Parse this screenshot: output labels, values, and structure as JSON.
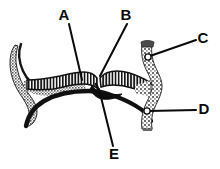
{
  "figure": {
    "kind": "labeled-anatomical-diagram",
    "background_color": "#ffffff",
    "ink_color": "#0a0a0a",
    "shade_color": "#9a9a9a",
    "hatch_color": "#1a1a1a",
    "width": 220,
    "height": 169,
    "caption": ""
  },
  "labels": [
    {
      "id": "A",
      "text": "A",
      "text_x": 64,
      "text_y": 16,
      "leader": {
        "x1": 69,
        "y1": 24,
        "x2": 82,
        "y2": 80
      }
    },
    {
      "id": "B",
      "text": "B",
      "text_x": 126,
      "text_y": 16,
      "leader": {
        "x1": 127,
        "y1": 24,
        "x2": 100,
        "y2": 76
      }
    },
    {
      "id": "C",
      "text": "C",
      "text_x": 201,
      "text_y": 39,
      "leader": {
        "x1": 196,
        "y1": 40,
        "x2": 148,
        "y2": 57
      }
    },
    {
      "id": "D",
      "text": "D",
      "text_x": 201,
      "text_y": 110,
      "leader": {
        "x1": 196,
        "y1": 110,
        "x2": 147,
        "y2": 111
      }
    },
    {
      "id": "E",
      "text": "E",
      "text_x": 111,
      "text_y": 155,
      "leader": {
        "x1": 113,
        "y1": 146,
        "x2": 99,
        "y2": 89
      }
    }
  ],
  "markers": [
    {
      "id": "marker-c",
      "cx": 148,
      "cy": 57,
      "r": 3.1
    },
    {
      "id": "marker-d",
      "cx": 147,
      "cy": 111,
      "r": 3.1
    }
  ],
  "structures": [
    {
      "id": "left-horn",
      "description": "left curved horn"
    },
    {
      "id": "hatched-band",
      "description": "central striped band"
    },
    {
      "id": "lower-arc",
      "description": "lower black arc"
    },
    {
      "id": "right-hourglass",
      "description": "right hourglass body"
    },
    {
      "id": "central-notch",
      "description": "dark central notch"
    }
  ]
}
